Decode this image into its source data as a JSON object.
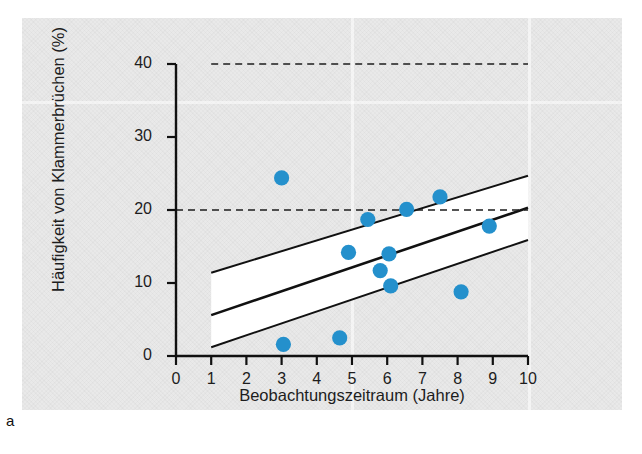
{
  "figure": {
    "letter": "a",
    "panel_color": "#e9e9e9",
    "marker_color": "#2490cc",
    "line_color": "#111111"
  },
  "chart_data": {
    "type": "scatter",
    "title": "",
    "xlabel": "Beobachtungszeitraum (Jahre)",
    "ylabel": "Häufigkeit von Klammerbrüchen (%)",
    "xlim": [
      0,
      10
    ],
    "ylim": [
      0,
      40
    ],
    "xticks": [
      0,
      1,
      2,
      3,
      4,
      5,
      6,
      7,
      8,
      9,
      10
    ],
    "yticks": [
      0,
      10,
      20,
      30,
      40
    ],
    "xtick_labels": [
      "0",
      "1",
      "2",
      "3",
      "4",
      "5",
      "6",
      "7",
      "8",
      "9",
      "10"
    ],
    "ytick_labels": [
      "0",
      "10",
      "20",
      "30",
      "40"
    ],
    "grid": false,
    "legend": "none",
    "points": [
      {
        "x": 3.0,
        "y": 24.4
      },
      {
        "x": 3.05,
        "y": 1.6
      },
      {
        "x": 4.65,
        "y": 2.5
      },
      {
        "x": 4.9,
        "y": 14.2
      },
      {
        "x": 5.45,
        "y": 18.7
      },
      {
        "x": 5.8,
        "y": 11.7
      },
      {
        "x": 6.05,
        "y": 14.0
      },
      {
        "x": 6.1,
        "y": 9.6
      },
      {
        "x": 6.55,
        "y": 20.1
      },
      {
        "x": 7.5,
        "y": 21.8
      },
      {
        "x": 8.1,
        "y": 8.8
      },
      {
        "x": 8.9,
        "y": 17.8
      }
    ],
    "regression_line": {
      "name": "Regressionsgerade",
      "x": [
        1,
        10
      ],
      "y": [
        5.6,
        20.3
      ]
    },
    "confidence_band": {
      "name": "Konfidenzband",
      "x": [
        1,
        10
      ],
      "upper": [
        11.4,
        24.7
      ],
      "lower": [
        1.2,
        15.9
      ],
      "fill": "#ffffff"
    },
    "reference_lines": [
      {
        "name": "reference-40",
        "y": 40,
        "style": "dashed",
        "x_from": 1,
        "x_to": 10
      },
      {
        "name": "reference-20",
        "y": 20,
        "style": "dashed",
        "x_from": 0,
        "x_to": 10
      }
    ]
  }
}
